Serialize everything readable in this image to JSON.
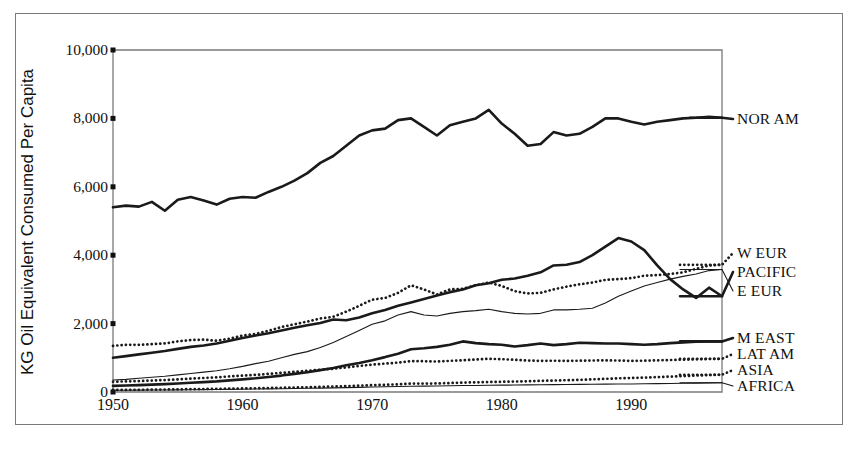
{
  "figure": {
    "ylabel": "KG Oil Equivalent Consumed Per Capita",
    "frame_color": "#7a7a7a",
    "line_color": "#1a1a1a"
  },
  "yticks": [
    {
      "value": 0,
      "label": "0"
    },
    {
      "value": 2000,
      "label": "2,000"
    },
    {
      "value": 4000,
      "label": "4,000"
    },
    {
      "value": 6000,
      "label": "6,000"
    },
    {
      "value": 8000,
      "label": "8,000"
    },
    {
      "value": 10000,
      "label": "10,000"
    }
  ],
  "xticks": [
    {
      "value": 1950,
      "label": "1950"
    },
    {
      "value": 1960,
      "label": "1960"
    },
    {
      "value": 1970,
      "label": "1970"
    },
    {
      "value": 1980,
      "label": "1980"
    },
    {
      "value": 1990,
      "label": "1990"
    }
  ],
  "legend": [
    {
      "key": "nor_am",
      "label": "NOR AM",
      "y": 119
    },
    {
      "key": "w_eur",
      "label": "W EUR",
      "y": 253
    },
    {
      "key": "pacific",
      "label": "PACIFIC",
      "y": 272
    },
    {
      "key": "e_eur",
      "label": "E EUR",
      "y": 291
    },
    {
      "key": "m_east",
      "label": "M EAST",
      "y": 338
    },
    {
      "key": "lat_am",
      "label": "LAT AM",
      "y": 354
    },
    {
      "key": "asia",
      "label": "ASIA",
      "y": 370
    },
    {
      "key": "africa",
      "label": "AFRICA",
      "y": 386
    }
  ],
  "chart_data": {
    "type": "line",
    "title": "",
    "xlabel": "",
    "ylabel": "KG Oil Equivalent Consumed Per Capita",
    "xlim": [
      1950,
      1997
    ],
    "ylim": [
      0,
      10000
    ],
    "grid": false,
    "legend_position": "right-outside",
    "x": [
      1950,
      1951,
      1952,
      1953,
      1954,
      1955,
      1956,
      1957,
      1958,
      1959,
      1960,
      1961,
      1962,
      1963,
      1964,
      1965,
      1966,
      1967,
      1968,
      1969,
      1970,
      1971,
      1972,
      1973,
      1974,
      1975,
      1976,
      1977,
      1978,
      1979,
      1980,
      1981,
      1982,
      1983,
      1984,
      1985,
      1986,
      1987,
      1988,
      1989,
      1990,
      1991,
      1992,
      1993,
      1994,
      1995,
      1996,
      1997
    ],
    "series": [
      {
        "name": "NOR AM",
        "style": "solid",
        "width": "thick",
        "values": [
          5400,
          5450,
          5420,
          5560,
          5300,
          5620,
          5700,
          5600,
          5480,
          5650,
          5700,
          5680,
          5850,
          6000,
          6180,
          6400,
          6700,
          6900,
          7200,
          7500,
          7650,
          7700,
          7950,
          8000,
          7750,
          7500,
          7800,
          7900,
          8000,
          8250,
          7850,
          7550,
          7200,
          7250,
          7600,
          7500,
          7550,
          7750,
          8000,
          8000,
          7900,
          7820,
          7900,
          7950,
          8000,
          8020,
          8050,
          8020
        ]
      },
      {
        "name": "W EUR",
        "style": "dotted",
        "width": "thick",
        "values": [
          1350,
          1380,
          1380,
          1400,
          1420,
          1480,
          1520,
          1530,
          1500,
          1560,
          1650,
          1700,
          1790,
          1900,
          1980,
          2060,
          2150,
          2200,
          2350,
          2520,
          2700,
          2750,
          2900,
          3120,
          3000,
          2850,
          3000,
          3020,
          3120,
          3200,
          3100,
          2950,
          2880,
          2900,
          3000,
          3080,
          3150,
          3200,
          3280,
          3300,
          3330,
          3400,
          3420,
          3450,
          3500,
          3600,
          3700,
          3720
        ]
      },
      {
        "name": "E EUR",
        "style": "solid",
        "width": "thick",
        "values": [
          1000,
          1050,
          1100,
          1150,
          1200,
          1260,
          1320,
          1360,
          1420,
          1500,
          1580,
          1650,
          1720,
          1800,
          1880,
          1950,
          2020,
          2120,
          2100,
          2180,
          2300,
          2400,
          2520,
          2620,
          2720,
          2820,
          2920,
          3000,
          3120,
          3180,
          3280,
          3320,
          3400,
          3500,
          3700,
          3720,
          3800,
          4000,
          4250,
          4500,
          4400,
          4150,
          3700,
          3300,
          3000,
          2750,
          3050,
          2800
        ]
      },
      {
        "name": "PACIFIC",
        "style": "solid",
        "width": "thin",
        "values": [
          350,
          370,
          400,
          430,
          460,
          500,
          540,
          580,
          620,
          680,
          750,
          830,
          900,
          1000,
          1100,
          1180,
          1300,
          1450,
          1620,
          1800,
          1980,
          2080,
          2250,
          2350,
          2250,
          2220,
          2300,
          2350,
          2380,
          2420,
          2350,
          2300,
          2280,
          2300,
          2400,
          2400,
          2420,
          2450,
          2600,
          2800,
          2950,
          3100,
          3200,
          3300,
          3380,
          3450,
          3550,
          3580
        ]
      },
      {
        "name": "M EAST",
        "style": "solid",
        "width": "thick",
        "values": [
          180,
          190,
          200,
          215,
          230,
          250,
          270,
          290,
          310,
          340,
          370,
          400,
          440,
          480,
          530,
          580,
          640,
          700,
          780,
          850,
          930,
          1020,
          1120,
          1250,
          1280,
          1320,
          1380,
          1480,
          1430,
          1400,
          1380,
          1330,
          1370,
          1420,
          1370,
          1400,
          1440,
          1430,
          1420,
          1420,
          1400,
          1380,
          1400,
          1430,
          1450,
          1470,
          1480,
          1480
        ]
      },
      {
        "name": "LAT AM",
        "style": "dotted",
        "width": "thick",
        "values": [
          300,
          310,
          320,
          335,
          350,
          370,
          390,
          410,
          430,
          455,
          480,
          500,
          530,
          560,
          590,
          620,
          650,
          680,
          720,
          760,
          800,
          830,
          860,
          900,
          900,
          890,
          910,
          930,
          950,
          970,
          960,
          940,
          920,
          910,
          915,
          910,
          915,
          920,
          925,
          920,
          910,
          915,
          925,
          935,
          945,
          955,
          965,
          970
        ]
      },
      {
        "name": "ASIA",
        "style": "dotted",
        "width": "thick",
        "values": [
          60,
          62,
          65,
          68,
          72,
          78,
          83,
          88,
          92,
          98,
          105,
          110,
          118,
          125,
          132,
          140,
          150,
          160,
          172,
          185,
          200,
          210,
          225,
          245,
          245,
          250,
          262,
          275,
          282,
          292,
          300,
          305,
          315,
          325,
          335,
          345,
          355,
          370,
          385,
          400,
          410,
          420,
          435,
          450,
          465,
          480,
          495,
          505
        ]
      },
      {
        "name": "AFRICA",
        "style": "solid",
        "width": "thin",
        "values": [
          50,
          52,
          54,
          57,
          60,
          63,
          66,
          70,
          73,
          77,
          82,
          86,
          91,
          96,
          102,
          108,
          114,
          120,
          128,
          136,
          145,
          152,
          160,
          170,
          172,
          175,
          182,
          188,
          192,
          198,
          200,
          203,
          208,
          212,
          215,
          218,
          222,
          226,
          230,
          233,
          236,
          240,
          245,
          250,
          255,
          260,
          268,
          272
        ]
      }
    ]
  }
}
